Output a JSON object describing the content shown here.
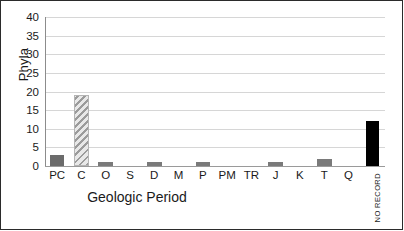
{
  "chart_data": {
    "type": "bar",
    "title": "",
    "xlabel": "Geologic Period",
    "ylabel": "Phyla",
    "ylim": [
      0,
      40
    ],
    "yticks": [
      0,
      5,
      10,
      15,
      20,
      25,
      30,
      35,
      40
    ],
    "grid": true,
    "legend": false,
    "categories": [
      "PC",
      "C",
      "O",
      "S",
      "D",
      "M",
      "P",
      "PM",
      "TR",
      "J",
      "K",
      "T",
      "Q",
      "NO RECORD"
    ],
    "values": [
      3,
      19,
      1,
      0,
      1,
      0,
      1,
      0,
      0,
      1,
      0,
      2,
      0,
      12
    ],
    "bar_styles": [
      "dark-gray",
      "hatch",
      "solid-gray",
      "empty",
      "solid-gray",
      "empty",
      "solid-gray",
      "empty",
      "empty",
      "solid-gray",
      "empty",
      "solid-gray",
      "empty",
      "black"
    ],
    "annotations": [
      {
        "text": "NO RECORD",
        "orientation": "vertical",
        "category": "NO RECORD"
      }
    ],
    "colors": {
      "dark_gray": "#6b6b6b",
      "solid_gray": "#7a7a7a",
      "hatch_gray": "#9b9b9b",
      "black": "#000000",
      "gridline": "#d6d6d6",
      "axis": "#8c8c8c",
      "frame": "#2b2b2b",
      "text": "#1a1a1a"
    }
  }
}
